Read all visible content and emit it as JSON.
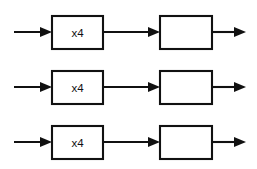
{
  "diagram": {
    "background_color": "#ffffff",
    "line_color": "#111111",
    "box_fill_color": "#ffffff",
    "rows": [
      {
        "name": "channel-1",
        "center_y": 32,
        "input_arrow": {
          "x1": 14,
          "x2": 52
        },
        "first_block": {
          "label": "x4",
          "x": 52,
          "y": 16,
          "width": 51,
          "height": 33
        },
        "link_arrow": {
          "x1": 103,
          "x2": 160
        },
        "second_block": {
          "label": "",
          "x": 160,
          "y": 16,
          "width": 52,
          "height": 33
        },
        "output_arrow": {
          "x1": 212,
          "x2": 246
        }
      },
      {
        "name": "channel-2",
        "center_y": 87,
        "input_arrow": {
          "x1": 14,
          "x2": 52
        },
        "first_block": {
          "label": "x4",
          "x": 52,
          "y": 71,
          "width": 51,
          "height": 33
        },
        "link_arrow": {
          "x1": 103,
          "x2": 160
        },
        "second_block": {
          "label": "",
          "x": 160,
          "y": 71,
          "width": 52,
          "height": 33
        },
        "output_arrow": {
          "x1": 212,
          "x2": 246
        }
      },
      {
        "name": "channel-3",
        "center_y": 142,
        "input_arrow": {
          "x1": 14,
          "x2": 52
        },
        "first_block": {
          "label": "x4",
          "x": 52,
          "y": 126,
          "width": 51,
          "height": 33
        },
        "link_arrow": {
          "x1": 103,
          "x2": 160
        },
        "second_block": {
          "label": "",
          "x": 160,
          "y": 126,
          "width": 52,
          "height": 33
        },
        "output_arrow": {
          "x1": 212,
          "x2": 246
        }
      }
    ]
  }
}
